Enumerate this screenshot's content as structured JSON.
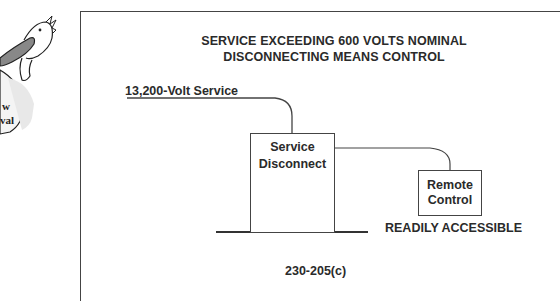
{
  "logo": {
    "icon": "pelican-mascot-icon",
    "text_line1": "w",
    "text_line2": "val"
  },
  "diagram": {
    "title_line1": "SERVICE EXCEEDING 600 VOLTS NOMINAL",
    "title_line2": "DISCONNECTING MEANS CONTROL",
    "service_label": "13,200-Volt Service",
    "disconnect_line1": "Service",
    "disconnect_line2": "Disconnect",
    "remote_line1": "Remote",
    "remote_line2": "Control",
    "accessibility_note": "READILY ACCESSIBLE",
    "code_reference": "230-205(c)"
  },
  "colors": {
    "line": "#444444",
    "text": "#2a2a2a",
    "background": "#ffffff"
  }
}
